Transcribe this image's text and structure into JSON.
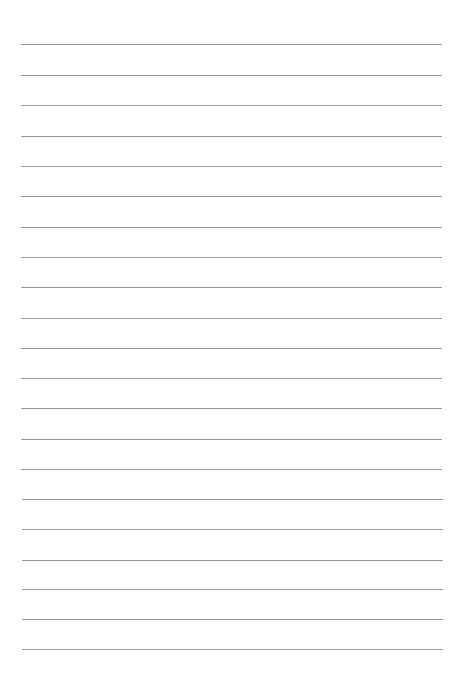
{
  "document": {
    "type": "lined-paper",
    "background_color": "#ffffff",
    "line_color": "#9a9a9a",
    "line_count": 21,
    "line_positions_y": [
      44,
      75,
      105,
      136,
      166,
      196,
      227,
      257,
      287,
      318,
      348,
      378,
      408,
      439,
      469,
      499,
      529,
      560,
      589,
      619,
      649
    ],
    "line_left_x": 21,
    "line_width": 421
  }
}
